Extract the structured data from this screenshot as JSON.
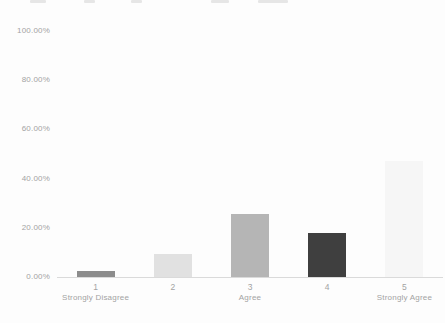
{
  "chart_data": {
    "type": "bar",
    "title": "",
    "categories": [
      "1",
      "2",
      "3",
      "4",
      "5"
    ],
    "category_sublabels": [
      "Strongly Disagree",
      "",
      "Agree",
      "",
      "Strongly Agree"
    ],
    "values": [
      2.5,
      9.5,
      25.5,
      18,
      47
    ],
    "bar_colors": [
      "#8c8c8c",
      "#e1e1e1",
      "#b5b5b5",
      "#3f3f3f",
      "#f6f6f6"
    ],
    "yticks": [
      "0.00%",
      "20.00%",
      "40.00%",
      "60.00%",
      "80.00%",
      "100.00%"
    ],
    "ytick_values": [
      0,
      20,
      40,
      60,
      80,
      100
    ],
    "ylim": [
      0,
      100
    ],
    "xlabel": "",
    "ylabel": "",
    "grid": "none",
    "legend": "none",
    "axis_line_color": "#dadada",
    "text_color": "#a3a3a3",
    "background": "#fdfdfd"
  }
}
